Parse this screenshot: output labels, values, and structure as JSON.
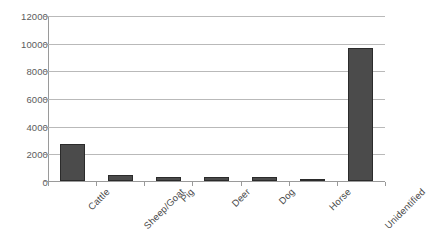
{
  "chart_data": {
    "type": "bar",
    "title": "",
    "subtitle": "",
    "xlabel": "",
    "ylabel": "",
    "categories": [
      "Cattle",
      "Sheep/Goat",
      "Pig",
      "Deer",
      "Dog",
      "Horse",
      "Unidentified"
    ],
    "values": [
      2680,
      430,
      320,
      300,
      300,
      180,
      9700
    ],
    "series": [
      {
        "name": "Count",
        "values": [
          2680,
          430,
          320,
          300,
          300,
          180,
          9700
        ]
      }
    ],
    "ylim": [
      0,
      12000
    ],
    "yticks": [
      0,
      2000,
      4000,
      6000,
      8000,
      10000,
      12000
    ],
    "ytick_labels": [
      "0",
      "2000",
      "4000",
      "6000",
      "8000",
      "10000",
      "12000"
    ],
    "grid": true,
    "grid_axis": "y",
    "legend": false,
    "legend_position": "none",
    "bar_color": "#4b4b4b",
    "bar_edge_color": "#2b2b2b",
    "gridline_color": "#b9b9b9",
    "axis_color": "#9a9a9a",
    "background_color": "#ffffff",
    "xtick_label_rotation": -45
  }
}
